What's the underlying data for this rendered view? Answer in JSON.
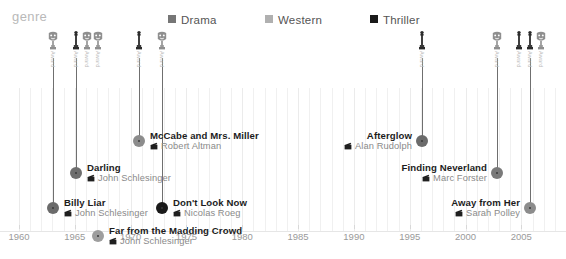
{
  "legend": {
    "title": "genre",
    "items": [
      {
        "label": "Drama",
        "color": "#767676",
        "swatch": "square-swatch"
      },
      {
        "label": "Western",
        "color": "#b0b0b0",
        "swatch": "square-swatch"
      },
      {
        "label": "Thriller",
        "color": "#1a1a1a",
        "swatch": "square-swatch"
      }
    ]
  },
  "axis": {
    "label": "",
    "ticks": [
      "1960",
      "1965",
      "1970",
      "1975",
      "1980",
      "1985",
      "1990",
      "1995",
      "2000",
      "2005"
    ],
    "min": 1960,
    "max": 2009,
    "step": 5
  },
  "awards": [
    {
      "year": 1963,
      "type": "bafta-mask-icon",
      "label": "Award",
      "x": 53
    },
    {
      "year": 1965,
      "type": "oscar-statue-icon",
      "label": "Award",
      "x": 76
    },
    {
      "year": 1966,
      "type": "bafta-mask-icon",
      "label": "Award",
      "x": 87
    },
    {
      "year": 1967,
      "type": "bafta-mask-icon",
      "label": "Award",
      "x": 98
    },
    {
      "year": 1971,
      "type": "oscar-statue-icon",
      "label": "Award",
      "x": 139
    },
    {
      "year": 1973,
      "type": "bafta-mask-icon",
      "label": "Award",
      "x": 162
    },
    {
      "year": 1997,
      "type": "oscar-statue-icon",
      "label": "Award",
      "x": 422
    },
    {
      "year": 2004,
      "type": "bafta-mask-icon",
      "label": "Award",
      "x": 497
    },
    {
      "year": 2006,
      "type": "oscar-statue-icon",
      "label": "Award",
      "x": 519
    },
    {
      "year": 2007,
      "type": "oscar-statue-icon",
      "label": "Award",
      "x": 530
    },
    {
      "year": 2008,
      "type": "bafta-mask-icon",
      "label": "Award",
      "x": 541
    }
  ],
  "films": [
    {
      "title": "McCabe and Mrs. Miller",
      "director": "Robert Altman",
      "genre": "Drama",
      "color": "#8c8c8c",
      "year": 1971,
      "x": 139,
      "y": 113,
      "radius": 6,
      "align": "left",
      "stem": true,
      "stem_top": 30
    },
    {
      "title": "Darling",
      "director": "John Schlesinger",
      "genre": "Drama",
      "color": "#6e6e6e",
      "year": 1965,
      "x": 76,
      "y": 145,
      "radius": 6,
      "align": "left",
      "stem": true,
      "stem_top": 30
    },
    {
      "title": "Billy Liar",
      "director": "John Schlesinger",
      "genre": "Drama",
      "color": "#6b6b6b",
      "year": 1963,
      "x": 53,
      "y": 180,
      "radius": 6,
      "align": "left",
      "stem": true,
      "stem_top": 30
    },
    {
      "title": "Don't Look Now",
      "director": "Nicolas Roeg",
      "genre": "Thriller",
      "color": "#1a1a1a",
      "year": 1973,
      "x": 162,
      "y": 180,
      "radius": 6,
      "align": "left",
      "stem": true,
      "stem_top": 30
    },
    {
      "title": "Far from the Madding Crowd",
      "director": "John Schlesinger",
      "genre": "Western",
      "color": "#9e9e9e",
      "year": 1967,
      "x": 98,
      "y": 208,
      "radius": 6,
      "align": "left",
      "stem": false,
      "stem_top": 0
    },
    {
      "title": "Afterglow",
      "director": "Alan Rudolph",
      "genre": "Drama",
      "color": "#6b6b6b",
      "year": 1997,
      "x": 422,
      "y": 113,
      "radius": 6,
      "align": "right",
      "stem": true,
      "stem_top": 30
    },
    {
      "title": "Finding Neverland",
      "director": "Marc Forster",
      "genre": "Drama",
      "color": "#7a7a7a",
      "year": 2004,
      "x": 497,
      "y": 145,
      "radius": 6,
      "align": "right",
      "stem": true,
      "stem_top": 30
    },
    {
      "title": "Away from Her",
      "director": "Sarah Polley",
      "genre": "Drama",
      "color": "#8c8c8c",
      "year": 2007,
      "x": 530,
      "y": 180,
      "radius": 6,
      "align": "right",
      "stem": true,
      "stem_top": 30
    }
  ],
  "chart_data": {
    "type": "scatter",
    "title": "",
    "xlabel": "",
    "ylabel": "",
    "xlim": [
      1960,
      2009
    ],
    "grid": true,
    "legend_position": "top",
    "categories": [
      "Drama",
      "Western",
      "Thriller"
    ],
    "series": [
      {
        "name": "Drama",
        "color": "#767676",
        "points": [
          {
            "x": 1971,
            "label": "McCabe and Mrs. Miller",
            "director": "Robert Altman"
          },
          {
            "x": 1965,
            "label": "Darling",
            "director": "John Schlesinger"
          },
          {
            "x": 1963,
            "label": "Billy Liar",
            "director": "John Schlesinger"
          },
          {
            "x": 1997,
            "label": "Afterglow",
            "director": "Alan Rudolph"
          },
          {
            "x": 2004,
            "label": "Finding Neverland",
            "director": "Marc Forster"
          },
          {
            "x": 2007,
            "label": "Away from Her",
            "director": "Sarah Polley"
          }
        ]
      },
      {
        "name": "Western",
        "color": "#b0b0b0",
        "points": [
          {
            "x": 1967,
            "label": "Far from the Madding Crowd",
            "director": "John Schlesinger"
          }
        ]
      },
      {
        "name": "Thriller",
        "color": "#1a1a1a",
        "points": [
          {
            "x": 1973,
            "label": "Don't Look Now",
            "director": "Nicolas Roeg"
          }
        ]
      }
    ],
    "award_years": [
      1963,
      1965,
      1966,
      1967,
      1971,
      1973,
      1997,
      2004,
      2006,
      2007,
      2008
    ]
  }
}
